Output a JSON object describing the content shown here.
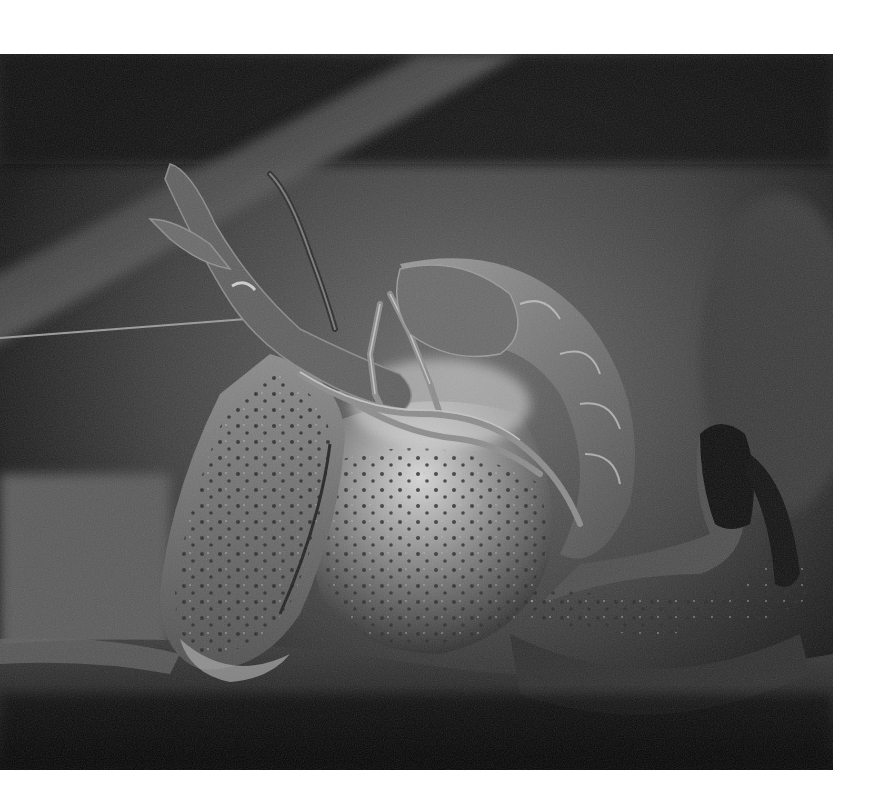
{
  "image": {
    "subject": "crayfish on a log",
    "style": "grayscale photograph",
    "alt": "Grayscale photograph of a crayfish curled on a dark log, claws raised toward upper left, spotted carapace and segmented tail"
  },
  "palette": {
    "page_background": "#ffffff",
    "deep_shadow": "#0a0a0a",
    "background_mid": "#4a4a4a",
    "background_light": "#7a7a7a",
    "body_mid": "#6e6e6e",
    "body_highlight": "#c8c8c8",
    "spot": "#2a2a2a"
  }
}
